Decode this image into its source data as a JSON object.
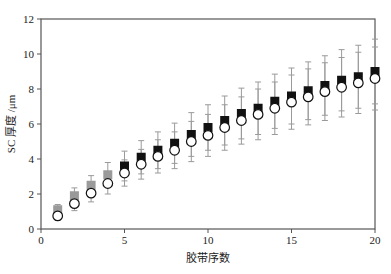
{
  "chart_data": {
    "type": "scatter",
    "title": "",
    "xlabel": "胶带序数",
    "ylabel": "SC 厚度 /μm",
    "xlim": [
      0,
      20
    ],
    "ylim": [
      0,
      12
    ],
    "xticks": [
      0,
      5,
      10,
      15,
      20
    ],
    "yticks": [
      0,
      2,
      4,
      6,
      8,
      10,
      12
    ],
    "grid": false,
    "legend": null,
    "x": [
      1,
      2,
      3,
      4,
      5,
      6,
      7,
      8,
      9,
      10,
      11,
      12,
      13,
      14,
      15,
      16,
      17,
      18,
      19,
      20
    ],
    "series": [
      {
        "name": "square",
        "marker": "filled-square",
        "color_early": "#9a9a9a",
        "color": "#111111",
        "gray_until_index": 4,
        "values": [
          1.1,
          1.9,
          2.5,
          3.1,
          3.6,
          4.1,
          4.5,
          4.9,
          5.4,
          5.8,
          6.2,
          6.6,
          6.9,
          7.3,
          7.6,
          7.9,
          8.2,
          8.5,
          8.7,
          9.0
        ],
        "error": [
          0.3,
          0.45,
          0.55,
          0.7,
          0.85,
          0.95,
          1.05,
          1.15,
          1.25,
          1.3,
          1.4,
          1.45,
          1.5,
          1.55,
          1.6,
          1.65,
          1.7,
          1.75,
          1.8,
          1.85
        ]
      },
      {
        "name": "circle",
        "marker": "open-circle",
        "color": "#111111",
        "values": [
          0.75,
          1.45,
          2.05,
          2.6,
          3.2,
          3.7,
          4.15,
          4.5,
          5.0,
          5.35,
          5.8,
          6.2,
          6.55,
          6.9,
          7.25,
          7.55,
          7.85,
          8.1,
          8.35,
          8.6
        ],
        "error": [
          0.25,
          0.4,
          0.5,
          0.6,
          0.75,
          0.85,
          0.95,
          1.05,
          1.15,
          1.2,
          1.3,
          1.35,
          1.45,
          1.5,
          1.55,
          1.6,
          1.65,
          1.7,
          1.75,
          1.8
        ]
      }
    ]
  },
  "axes": {
    "x_title": "胶带序数",
    "y_title": "SC 厚度 /μm",
    "x_tick_labels": [
      "0",
      "5",
      "10",
      "15",
      "20"
    ],
    "y_tick_labels": [
      "0",
      "2",
      "4",
      "6",
      "8",
      "10",
      "12"
    ]
  }
}
